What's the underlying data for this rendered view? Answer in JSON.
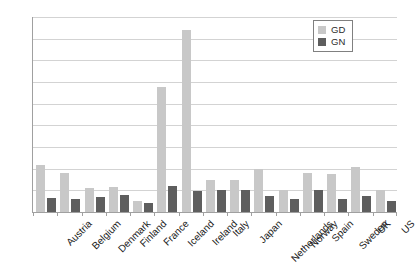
{
  "chart_data": {
    "type": "bar",
    "title": "",
    "subtitle": "",
    "xlabel": "",
    "ylabel": "",
    "ylim": [
      0,
      18
    ],
    "yticks": [
      0,
      2,
      4,
      6,
      8,
      10,
      12,
      14,
      16,
      18
    ],
    "grid": true,
    "legend_position": "top-right",
    "categories": [
      "Austria",
      "Belgium",
      "Denmark",
      "Finland",
      "France",
      "Iceland",
      "Ireland",
      "Italy",
      "Japan",
      "Netherlands",
      "Norway",
      "Spain",
      "Sweden",
      "UK",
      "US"
    ],
    "series": [
      {
        "name": "GD",
        "color": "#c8c8c8",
        "values": [
          4.3,
          3.6,
          2.2,
          2.3,
          1.0,
          11.5,
          16.8,
          3.0,
          3.0,
          4.0,
          2.0,
          3.6,
          3.5,
          4.2,
          2.0
        ]
      },
      {
        "name": "GN",
        "color": "#5e5e5e",
        "values": [
          1.3,
          1.2,
          1.4,
          1.6,
          0.8,
          2.4,
          1.9,
          2.0,
          2.0,
          1.5,
          1.2,
          2.0,
          1.2,
          1.5,
          1.0
        ]
      }
    ]
  },
  "legend": {
    "entries": [
      {
        "label": "GD",
        "color": "#c8c8c8"
      },
      {
        "label": "GN",
        "color": "#5e5e5e"
      }
    ]
  },
  "colors": {
    "gd": "#c8c8c8",
    "gn": "#5e5e5e",
    "grid": "#d3d3d3",
    "axis": "#a0a0a0",
    "text": "#1a1a1a"
  }
}
